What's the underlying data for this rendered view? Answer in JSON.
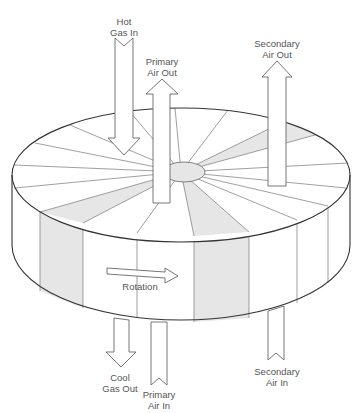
{
  "diagram": {
    "labels": {
      "hot_gas_in": [
        "Hot",
        "Gas In"
      ],
      "primary_air_out": [
        "Primary",
        "Air Out"
      ],
      "secondary_air_out": [
        "Secondary",
        "Air Out"
      ],
      "cool_gas_out": [
        "Cool",
        "Gas Out"
      ],
      "primary_air_in": [
        "Primary",
        "Air In"
      ],
      "secondary_air_in": [
        "Secondary",
        "Air In"
      ],
      "rotation": "Rotation"
    },
    "colors": {
      "background": "#ffffff",
      "outline": "#333333",
      "sector_lines": "#777777",
      "shaded_sector": "#e6e6e6",
      "text": "#555555"
    }
  }
}
